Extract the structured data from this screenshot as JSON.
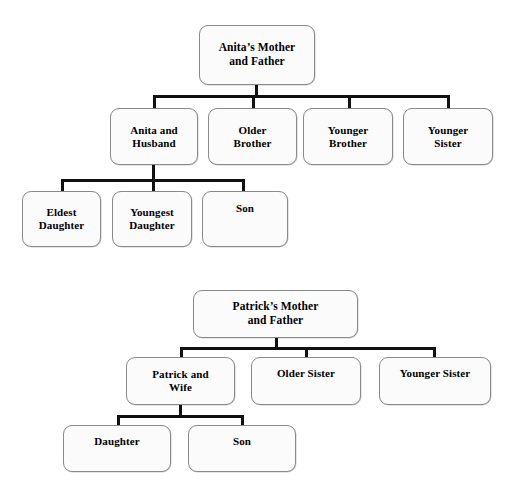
{
  "diagram": {
    "title_semantic": "family-tree-diagram",
    "style": {
      "box_fill": "#fbfbfb",
      "box_border": "#8a8a8a",
      "connector_color": "#111111",
      "text_color": "#000000",
      "background": "#ffffff"
    }
  },
  "tree_anita": {
    "name": "anitas-family-tree",
    "root": {
      "line1": "Anita’s Mother",
      "line2": "and Father"
    },
    "generation2": [
      {
        "line1": "Anita and",
        "line2": "Husband"
      },
      {
        "line1": "Older",
        "line2": "Brother"
      },
      {
        "line1": "Younger",
        "line2": "Brother"
      },
      {
        "line1": "Younger",
        "line2": "Sister"
      }
    ],
    "generation3": [
      {
        "line1": "Eldest",
        "line2": "Daughter"
      },
      {
        "line1": "Youngest",
        "line2": "Daughter"
      },
      {
        "line1": "Son",
        "line2": ""
      }
    ]
  },
  "tree_patrick": {
    "name": "patricks-family-tree",
    "root": {
      "line1": "Patrick’s Mother",
      "line2": "and Father"
    },
    "generation2": [
      {
        "line1": "Patrick and",
        "line2": "Wife"
      },
      {
        "line1": "Older Sister",
        "line2": ""
      },
      {
        "line1": "Younger Sister",
        "line2": ""
      }
    ],
    "generation3": [
      {
        "line1": "Daughter",
        "line2": ""
      },
      {
        "line1": "Son",
        "line2": ""
      }
    ]
  }
}
